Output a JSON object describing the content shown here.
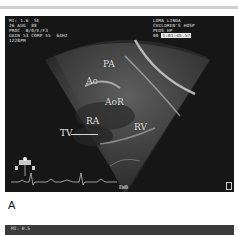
{
  "figure": {
    "panel_label": "A",
    "panel_a": {
      "overlay_left": [
        "MI: 1.6  SE",
        "26 AUG  88",
        "PROC  B/0/E/F3",
        "GAIN 53 COMP 55  64HZ",
        "1228PM"
      ],
      "overlay_right": [
        "LOMA LINDA",
        "CHILDREN'S HOSP",
        "PEDS HP",
        "00"
      ],
      "overlay_right_highlight": "1:01:45.57",
      "anatomy_labels": {
        "pa": "PA",
        "ao": "Ao",
        "aor": "AoR",
        "ra": "RA",
        "rv": "RV",
        "tv": "TV"
      },
      "probe_marker": "EWB"
    },
    "panel_b": {
      "overlay_left": "MI: 0.5"
    }
  }
}
